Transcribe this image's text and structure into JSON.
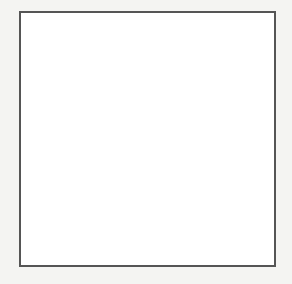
{
  "chart_data": {
    "type": "line",
    "xlabel": "x",
    "ylabel": "y",
    "xlim": [
      -6,
      6
    ],
    "ylim": [
      -6,
      6
    ],
    "grid": true,
    "x_ticks": [
      -5,
      -4,
      -3,
      -2,
      -1,
      1,
      2,
      3,
      4,
      5
    ],
    "y_ticks": [
      -5,
      -4,
      -3,
      -2,
      -1,
      1,
      2,
      3,
      4,
      5
    ],
    "series": [
      {
        "name": "y = -x^2 + 4",
        "x": [
          -3.2,
          -3,
          -2,
          -1,
          0,
          1,
          2,
          3,
          3.2
        ],
        "y": [
          -6.24,
          -5,
          0,
          3,
          4,
          3,
          0,
          -5,
          -6.24
        ],
        "arrows": "both ends"
      }
    ],
    "colors": {
      "curve": "#3a3a3a",
      "grid": "#cfcfcf",
      "axis": "#333333",
      "border": "#555555"
    }
  },
  "labels": {
    "x_axis": "x",
    "y_axis": "y"
  }
}
